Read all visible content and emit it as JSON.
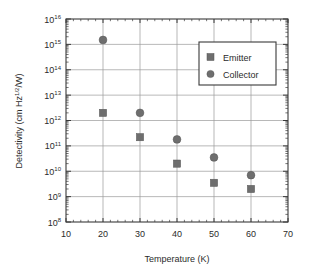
{
  "chart_data": {
    "type": "scatter",
    "title": "",
    "xlabel": "Temperature (K)",
    "ylabel": "Detectivity (cm Hz",
    "ylabel_sup": "1/2",
    "ylabel_tail": "/W)",
    "xlim": [
      10,
      70
    ],
    "ylim": [
      100000000.0,
      1e+16
    ],
    "yscale": "log",
    "xscale": "linear",
    "grid": true,
    "legend_position": "upper-right",
    "x_ticks": [
      10,
      20,
      30,
      40,
      50,
      60,
      70
    ],
    "x_tick_labels": [
      "10",
      "20",
      "30",
      "40",
      "50",
      "60",
      "70"
    ],
    "x_minor_step": 2,
    "y_ticks": [
      100000000.0,
      1000000000.0,
      10000000000.0,
      100000000000.0,
      1000000000000.0,
      10000000000000.0,
      100000000000000.0,
      1000000000000000.0,
      1e+16
    ],
    "y_tick_mantissa": "10",
    "y_tick_exponents": [
      "8",
      "9",
      "10",
      "11",
      "12",
      "13",
      "14",
      "15",
      "16"
    ],
    "marker_color": "#6e6e6e",
    "series": [
      {
        "name": "Emitter",
        "marker": "square",
        "x": [
          20,
          30,
          40,
          50,
          60
        ],
        "values": [
          2000000000000.0,
          220000000000.0,
          20000000000.0,
          3500000000.0,
          2000000000.0
        ]
      },
      {
        "name": "Collector",
        "marker": "circle",
        "x": [
          20,
          30,
          40,
          50,
          60
        ],
        "values": [
          1500000000000000.0,
          2000000000000.0,
          180000000000.0,
          35000000000.0,
          7000000000.0
        ]
      }
    ]
  },
  "legend": {
    "entries": [
      {
        "label": "Emitter",
        "marker": "square"
      },
      {
        "label": "Collector",
        "marker": "circle"
      }
    ]
  }
}
